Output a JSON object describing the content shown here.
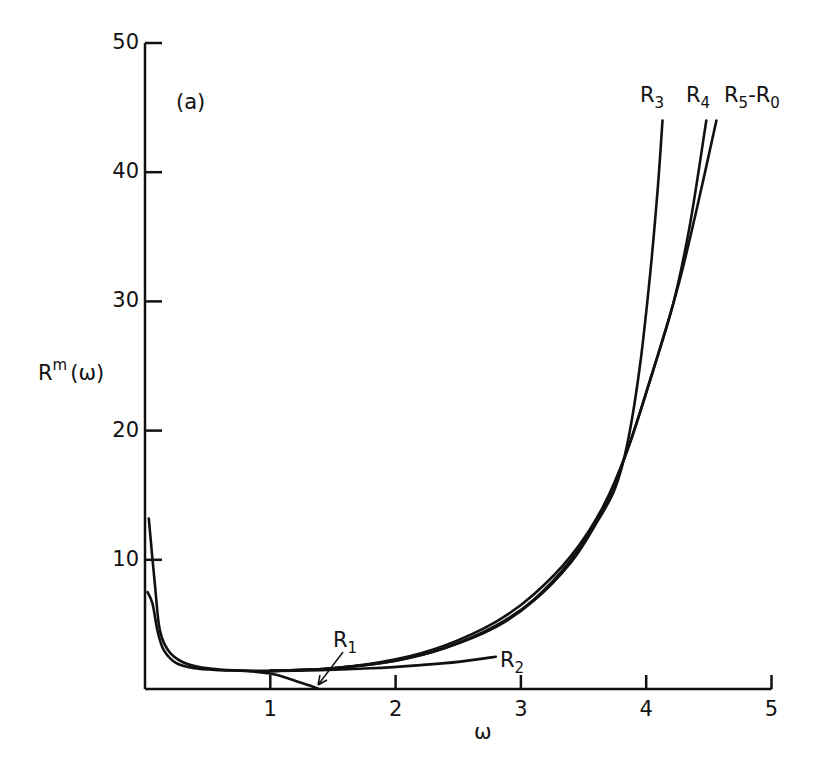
{
  "chart_data": {
    "type": "line",
    "title": "",
    "panel_label": "(a)",
    "xlabel": "ω",
    "ylabel": "R^m(ω)",
    "ylabel_parts": {
      "base": "R",
      "sup": "m",
      "arg": "(ω)"
    },
    "xlim": [
      0,
      5
    ],
    "ylim": [
      0,
      50
    ],
    "xticks": [
      1,
      2,
      3,
      4,
      5
    ],
    "yticks": [
      10,
      20,
      30,
      40,
      50
    ],
    "grid": false,
    "legend": "inline labels near curve ends",
    "series": [
      {
        "name": "R1",
        "label_base": "R",
        "label_sub": "1",
        "points": [
          [
            0.02,
            7.5
          ],
          [
            0.06,
            6.6
          ],
          [
            0.1,
            4.5
          ],
          [
            0.15,
            3.0
          ],
          [
            0.25,
            2.0
          ],
          [
            0.4,
            1.6
          ],
          [
            0.6,
            1.45
          ],
          [
            0.8,
            1.4
          ],
          [
            1.0,
            1.2
          ],
          [
            1.15,
            0.8
          ],
          [
            1.3,
            0.3
          ],
          [
            1.38,
            0.05
          ]
        ]
      },
      {
        "name": "R2",
        "label_base": "R",
        "label_sub": "2",
        "points": [
          [
            0.03,
            13.2
          ],
          [
            0.08,
            8.0
          ],
          [
            0.12,
            4.5
          ],
          [
            0.2,
            2.8
          ],
          [
            0.35,
            1.9
          ],
          [
            0.6,
            1.5
          ],
          [
            1.0,
            1.4
          ],
          [
            1.4,
            1.45
          ],
          [
            1.8,
            1.6
          ],
          [
            2.2,
            1.85
          ],
          [
            2.5,
            2.1
          ],
          [
            2.8,
            2.5
          ]
        ]
      },
      {
        "name": "R3",
        "label_base": "R",
        "label_sub": "3",
        "points": [
          [
            1.0,
            1.4
          ],
          [
            1.5,
            1.6
          ],
          [
            2.0,
            2.2
          ],
          [
            2.4,
            3.2
          ],
          [
            2.8,
            4.8
          ],
          [
            3.1,
            6.8
          ],
          [
            3.4,
            9.8
          ],
          [
            3.6,
            12.8
          ],
          [
            3.75,
            15.5
          ],
          [
            3.85,
            19.0
          ],
          [
            3.95,
            25.0
          ],
          [
            4.03,
            32.0
          ],
          [
            4.09,
            38.5
          ],
          [
            4.13,
            44.0
          ]
        ]
      },
      {
        "name": "R4",
        "label_base": "R",
        "label_sub": "4",
        "points": [
          [
            1.0,
            1.4
          ],
          [
            1.5,
            1.6
          ],
          [
            2.0,
            2.3
          ],
          [
            2.4,
            3.4
          ],
          [
            2.8,
            5.2
          ],
          [
            3.1,
            7.3
          ],
          [
            3.4,
            10.3
          ],
          [
            3.65,
            14.0
          ],
          [
            3.85,
            18.5
          ],
          [
            4.05,
            24.5
          ],
          [
            4.22,
            30.0
          ],
          [
            4.35,
            36.0
          ],
          [
            4.48,
            44.0
          ]
        ]
      },
      {
        "name": "R5-R0",
        "label_base": "R",
        "label_sub": "5",
        "label_suffix": "-R",
        "label_sub2": "0",
        "points": [
          [
            1.0,
            1.4
          ],
          [
            1.5,
            1.6
          ],
          [
            2.0,
            2.2
          ],
          [
            2.4,
            3.2
          ],
          [
            2.8,
            4.9
          ],
          [
            3.1,
            6.9
          ],
          [
            3.4,
            10.0
          ],
          [
            3.65,
            13.8
          ],
          [
            3.85,
            18.5
          ],
          [
            4.05,
            24.5
          ],
          [
            4.25,
            31.0
          ],
          [
            4.4,
            37.0
          ],
          [
            4.56,
            44.0
          ]
        ]
      }
    ]
  }
}
